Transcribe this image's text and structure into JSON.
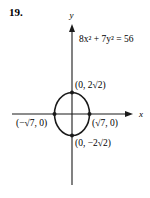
{
  "problem": {
    "number": "19."
  },
  "graph": {
    "equation": "8x² + 7y² = 56",
    "x_axis_label": "x",
    "y_axis_label": "y",
    "points": [
      {
        "name": "top-vertex",
        "label": "(0, 2√2)"
      },
      {
        "name": "left-vertex",
        "label": "(−√7, 0)"
      },
      {
        "name": "right-vertex",
        "label": "(√7, 0)"
      },
      {
        "name": "bottom-vertex",
        "label": "(0, −2√2)"
      }
    ],
    "colors": {
      "ink": "#1a1a1a",
      "background": "#ffffff"
    }
  }
}
